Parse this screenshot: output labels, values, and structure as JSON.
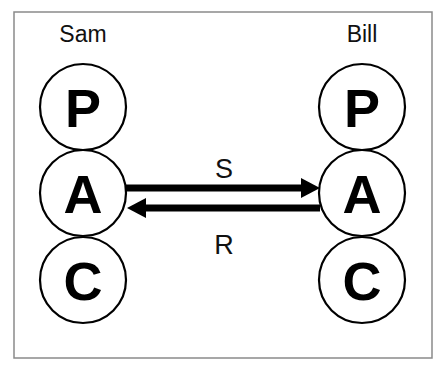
{
  "diagram": {
    "left_party": {
      "name": "Sam",
      "states": [
        "P",
        "A",
        "C"
      ]
    },
    "right_party": {
      "name": "Bill",
      "states": [
        "P",
        "A",
        "C"
      ]
    },
    "transactions": [
      {
        "label": "S",
        "from": "Sam.A",
        "to": "Bill.A",
        "direction": "right"
      },
      {
        "label": "R",
        "from": "Bill.A",
        "to": "Sam.A",
        "direction": "left"
      }
    ]
  }
}
